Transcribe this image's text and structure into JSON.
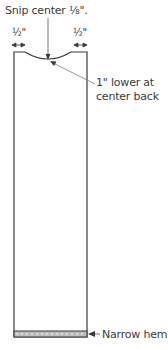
{
  "diagram": {
    "title": "Snip center ⅛\".",
    "dimensions": {
      "left": "½\"",
      "right": "½\""
    },
    "annotations": {
      "center_back_line1": "1\" lower at",
      "center_back_line2": "center back",
      "hem": "Narrow hem"
    },
    "colors": {
      "line": "#3a3a3a",
      "hem_fill": "#bdbdbd",
      "leader": "#8a8a8a"
    }
  }
}
